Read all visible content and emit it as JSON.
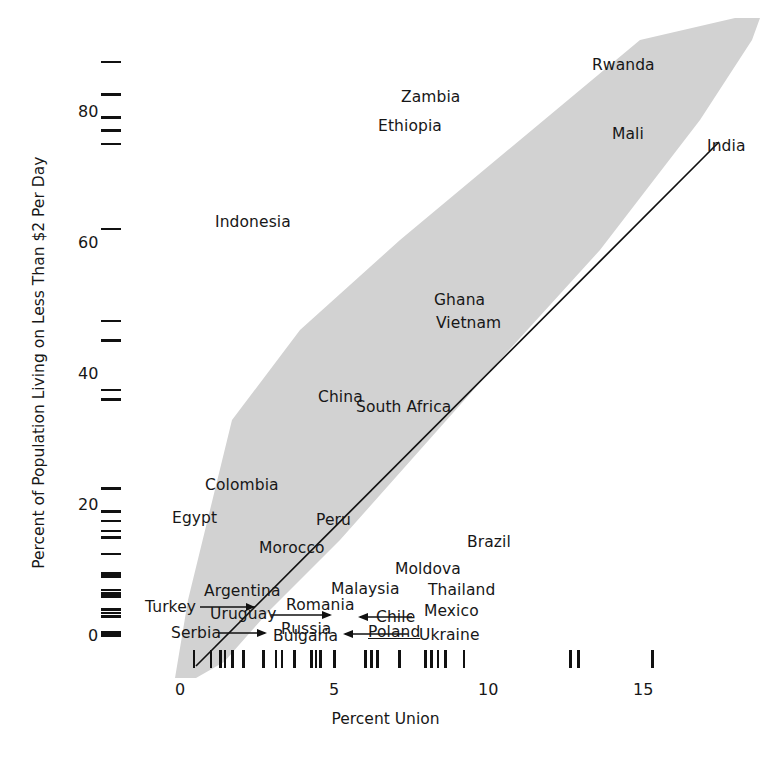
{
  "chart_data": {
    "type": "scatter",
    "title": "",
    "subtitle": "",
    "xlabel": "Percent Union",
    "ylabel": "Percent of Population Living on Less Than $2 Per Day",
    "xlim": [
      -0.3,
      16.2
    ],
    "ylim": [
      -6,
      92
    ],
    "xticks": [
      0,
      5,
      10,
      15
    ],
    "xticklabels": [
      "0",
      "5",
      "10",
      "15"
    ],
    "yticks": [
      0,
      20,
      40,
      60,
      80
    ],
    "yticklabels": [
      "0",
      "20",
      "40",
      "60",
      "80"
    ],
    "grid": false,
    "legend": null,
    "points": [
      {
        "label": "Rwanda",
        "x": 12.0,
        "y": 88.0
      },
      {
        "label": "Zambia",
        "x": 7.0,
        "y": 83.0
      },
      {
        "label": "Ethiopia",
        "x": 6.3,
        "y": 79.5
      },
      {
        "label": "Mali",
        "x": 12.6,
        "y": 77.5
      },
      {
        "label": "India",
        "x": 15.2,
        "y": 75.5
      },
      {
        "label": "Indonesia",
        "x": 2.5,
        "y": 62.5
      },
      {
        "label": "Ghana",
        "x": 8.2,
        "y": 48.5
      },
      {
        "label": "Vietnam",
        "x": 8.1,
        "y": 45.5
      },
      {
        "label": "China",
        "x": 5.2,
        "y": 38.0
      },
      {
        "label": "South Africa",
        "x": 6.3,
        "y": 36.5
      },
      {
        "label": "Colombia",
        "x": 2.3,
        "y": 23.0
      },
      {
        "label": "Egypt",
        "x": 1.1,
        "y": 19.5
      },
      {
        "label": "Peru",
        "x": 4.6,
        "y": 18.0
      },
      {
        "label": "Morocco",
        "x": 3.5,
        "y": 15.5
      },
      {
        "label": "Brazil",
        "x": 9.6,
        "y": 16.5
      },
      {
        "label": "Moldova",
        "x": 8.4,
        "y": 13.0
      },
      {
        "label": "Malaysia",
        "x": 6.2,
        "y": 10.0
      },
      {
        "label": "Thailand",
        "x": 9.7,
        "y": 10.0
      },
      {
        "label": "Argentina",
        "x": 2.9,
        "y": 7.5
      },
      {
        "label": "Romania",
        "x": 5.5,
        "y": 7.0
      },
      {
        "label": "Mexico",
        "x": 9.4,
        "y": 6.5
      },
      {
        "label": "Turkey",
        "x": 0.6,
        "y": 4.5
      },
      {
        "label": "Uruguay",
        "x": 2.6,
        "y": 4.0
      },
      {
        "label": "Chile",
        "x": 7.8,
        "y": 3.5
      },
      {
        "label": "Serbia",
        "x": 1.3,
        "y": 1.0
      },
      {
        "label": "Bulgaria",
        "x": 4.4,
        "y": 0.5
      },
      {
        "label": "Russia",
        "x": 4.9,
        "y": 1.0
      },
      {
        "label": "Poland",
        "x": 8.0,
        "y": 0.8
      },
      {
        "label": "Ukraine",
        "x": 9.1,
        "y": 0.8
      }
    ],
    "leader_lines": [
      {
        "label": "Turkey",
        "direction": "right"
      },
      {
        "label": "Uruguay",
        "direction": "right"
      },
      {
        "label": "Serbia",
        "direction": "right"
      },
      {
        "label": "Chile",
        "direction": "left"
      },
      {
        "label": "Poland",
        "direction": "left"
      }
    ],
    "fit_line": {
      "x_start": 0.1,
      "y_start": -3.0,
      "x_end": 15.2,
      "y_end": 75.5,
      "color": "#111111",
      "kind": "linear regression"
    },
    "confidence_band": {
      "color": "#d2d2d2",
      "description": "grey shaded band widening toward both ends of the fitted line"
    },
    "x_rug_values": [
      0.35,
      0.9,
      1.2,
      1.35,
      1.6,
      1.95,
      2.6,
      3.0,
      3.2,
      3.6,
      4.15,
      4.3,
      4.45,
      4.9,
      5.9,
      6.1,
      6.3,
      7.0,
      7.85,
      8.05,
      8.25,
      8.5,
      9.1,
      12.55,
      12.8,
      15.2
    ],
    "y_rug_values": [
      88.0,
      83.0,
      79.5,
      77.5,
      75.5,
      62.5,
      48.5,
      45.5,
      38.0,
      36.5,
      23.0,
      19.5,
      18.0,
      16.5,
      15.5,
      13.0,
      10.0,
      9.6,
      7.5,
      7.0,
      6.5,
      4.5,
      4.0,
      3.5,
      1.0,
      0.8,
      0.5
    ]
  },
  "axes": {
    "xlabel": "Percent Union",
    "ylabel": "Percent of Population Living on Less Than $2 Per Day",
    "xticklabels": [
      "0",
      "5",
      "10",
      "15"
    ],
    "yticklabels": [
      "0",
      "20",
      "40",
      "60",
      "80"
    ]
  },
  "labels": {
    "rwanda": "Rwanda",
    "zambia": "Zambia",
    "ethiopia": "Ethiopia",
    "mali": "Mali",
    "india": "India",
    "indonesia": "Indonesia",
    "ghana": "Ghana",
    "vietnam": "Vietnam",
    "china": "China",
    "south_africa": "South Africa",
    "colombia": "Colombia",
    "egypt": "Egypt",
    "peru": "Peru",
    "morocco": "Morocco",
    "brazil": "Brazil",
    "moldova": "Moldova",
    "malaysia": "Malaysia",
    "thailand": "Thailand",
    "argentina": "Argentina",
    "romania": "Romania",
    "mexico": "Mexico",
    "turkey": "Turkey",
    "uruguay": "Uruguay",
    "chile": "Chile",
    "serbia": "Serbia",
    "bulgaria": "Bulgaria",
    "russia": "Russia",
    "poland": "Poland",
    "ukraine": "Ukraine"
  },
  "colors": {
    "band": "#d2d2d2",
    "line": "#111111",
    "text": "#171717",
    "background": "#ffffff"
  }
}
